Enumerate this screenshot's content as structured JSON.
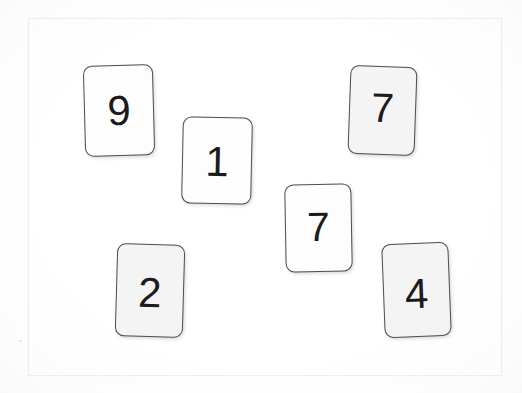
{
  "scene": {
    "title": "Scattered number cards",
    "background_color": "#ffffff",
    "frame": {
      "name": "surface-frame",
      "x": 28,
      "y": 18,
      "width": 474,
      "height": 358,
      "border_color": "#f0f0f0",
      "fill_color": "#ffffff"
    },
    "card_border_color": "#4f4f4f",
    "digit_color": "#1b1b1b",
    "card_fill_white": "#fdfdfd",
    "card_fill_grey": "#f4f4f4"
  },
  "cards": [
    {
      "id": "card-9",
      "value": "9",
      "x": 84,
      "y": 65,
      "width": 70,
      "height": 91,
      "rotation": -1.5,
      "fill": "#fdfdfd",
      "shade": "white",
      "font_size": 42,
      "digit_offset_y": 0
    },
    {
      "id": "card-1",
      "value": "1",
      "x": 182,
      "y": 117,
      "width": 70,
      "height": 87,
      "rotation": 1.2,
      "fill": "#fdfdfd",
      "shade": "white",
      "font_size": 42,
      "digit_offset_y": 1
    },
    {
      "id": "card-7-top-right",
      "value": "7",
      "x": 349,
      "y": 66,
      "width": 67,
      "height": 89,
      "rotation": 2.0,
      "fill": "#f4f4f4",
      "shade": "grey",
      "font_size": 41,
      "digit_offset_y": -2
    },
    {
      "id": "card-7-middle",
      "value": "7",
      "x": 285,
      "y": 184,
      "width": 67,
      "height": 88,
      "rotation": -1.0,
      "fill": "#fdfdfd",
      "shade": "white",
      "font_size": 41,
      "digit_offset_y": -1
    },
    {
      "id": "card-2",
      "value": "2",
      "x": 116,
      "y": 244,
      "width": 68,
      "height": 93,
      "rotation": 1.6,
      "fill": "#f4f4f4",
      "shade": "grey",
      "font_size": 42,
      "digit_offset_y": 2
    },
    {
      "id": "card-4",
      "value": "4",
      "x": 383,
      "y": 243,
      "width": 67,
      "height": 94,
      "rotation": -2.2,
      "fill": "#f4f4f4",
      "shade": "grey",
      "font_size": 42,
      "digit_offset_y": 4
    }
  ]
}
